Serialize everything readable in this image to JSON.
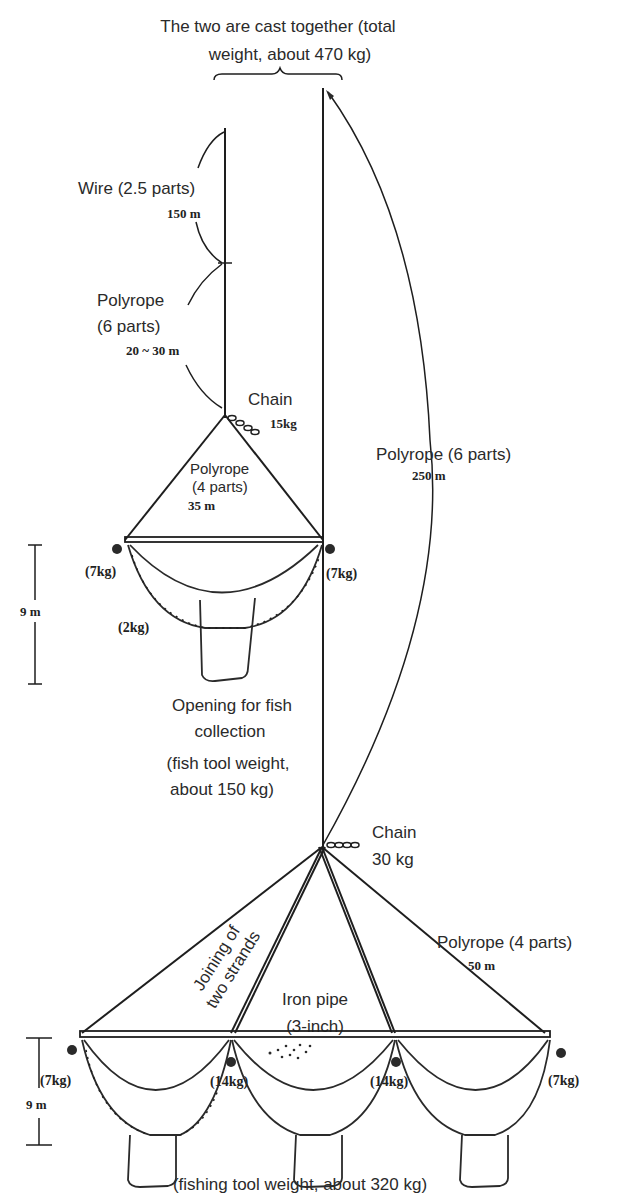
{
  "title": {
    "line1": "The two are cast together (total",
    "line2": "weight, about 470 kg)"
  },
  "upper_rig": {
    "wire_label": "Wire (2.5 parts)",
    "wire_length": "150 m",
    "polyrope_label_1": "Polyrope",
    "polyrope_label_2": "(6 parts)",
    "polyrope_length": "20 ~ 30 m",
    "chain_label": "Chain",
    "chain_weight": "15kg",
    "bridle_label_1": "Polyrope",
    "bridle_label_2": "(4 parts)",
    "bridle_length": "35 m",
    "left_weight": "(7kg)",
    "right_weight": "(7kg)",
    "sinker_weight": "(2kg)",
    "height": "9 m"
  },
  "main_line": {
    "label": "Polyrope (6 parts)",
    "length": "250 m"
  },
  "middle_notes": {
    "line1": "Opening for fish",
    "line2": "collection",
    "line3": "(fish tool weight,",
    "line4": "about 150 kg)"
  },
  "lower_rig": {
    "chain_label": "Chain",
    "chain_weight": "30 kg",
    "joining_1": "Joining of",
    "joining_2": "two strands",
    "pipe_1": "Iron pipe",
    "pipe_2": "(3-inch)",
    "bridle_label": "Polyrope (4 parts)",
    "bridle_length": "50 m",
    "weights": [
      "(7kg)",
      "(14kg)",
      "(14kg)",
      "(7kg)"
    ],
    "height": "9 m",
    "caption": "(fishing tool weight, about 320 kg)"
  }
}
